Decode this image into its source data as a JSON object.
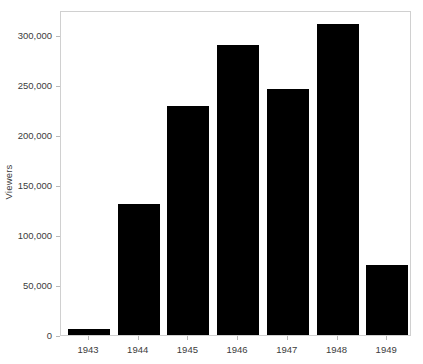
{
  "chart_data": {
    "type": "bar",
    "title": "",
    "subtitle": "",
    "xlabel": "",
    "ylabel": "Viewers",
    "categories": [
      "1943",
      "1944",
      "1945",
      "1946",
      "1947",
      "1948",
      "1949"
    ],
    "values": [
      6000,
      131000,
      229000,
      290000,
      246000,
      311000,
      70000
    ],
    "series": [
      {
        "name": "Viewers",
        "values": [
          6000,
          131000,
          229000,
          290000,
          246000,
          311000,
          70000
        ]
      }
    ],
    "ylim": [
      0,
      325000
    ],
    "y_ticks": [
      0,
      50000,
      100000,
      150000,
      200000,
      250000,
      300000
    ],
    "y_tick_labels": [
      "0",
      "50,000",
      "100,000",
      "150,000",
      "200,000",
      "250,000",
      "300,000"
    ],
    "grid": false,
    "legend": false,
    "legend_position": "none",
    "bar_color": "#000000",
    "frame_color": "#d0d0d0",
    "tick_color": "#b8b8b8",
    "text_color": "#3c3c3c",
    "background_color": "#ffffff"
  }
}
